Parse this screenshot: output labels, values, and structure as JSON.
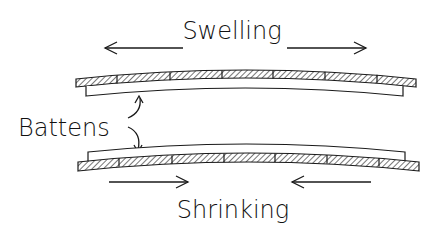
{
  "diagram": {
    "labels": {
      "swelling": "Swelling",
      "battens": "Battens",
      "shrinking": "Shrinking"
    },
    "colors": {
      "stroke": "#1a1a1a",
      "hatch": "#1a1a1a",
      "background": "#ffffff"
    },
    "top_assembly": {
      "state": "swelling",
      "board_segments": 7,
      "curvature": "convex (crowned upward)",
      "arrows": [
        "left",
        "right"
      ]
    },
    "bottom_assembly": {
      "state": "shrinking",
      "board_segments": 7,
      "curvature": "concave (cupped)",
      "arrows": [
        "right",
        "left"
      ]
    }
  }
}
